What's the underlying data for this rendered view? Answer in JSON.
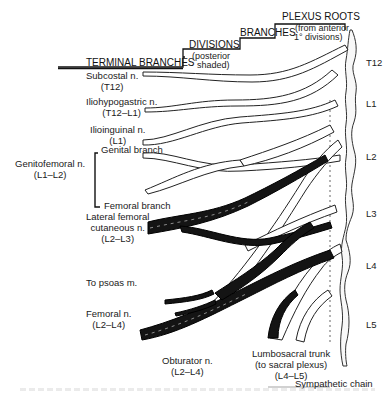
{
  "figure": {
    "type": "anatomical-diagram"
  },
  "headers": {
    "terminal_branches": "TERMINAL BRANCHES",
    "divisions": "DIVISIONS",
    "divisions_note_1": "(posterior",
    "divisions_note_2": "shaded)",
    "branches": "BRANCHES",
    "plexus_roots": "PLEXUS ROOTS",
    "plexus_roots_note_1": "(from anterior",
    "plexus_roots_note_2": "1° divisions)"
  },
  "nerves": [
    {
      "name": "Subcostal n.",
      "roots": "(T12)"
    },
    {
      "name": "Iliohypogastric n.",
      "roots": "(T12–L1)"
    },
    {
      "name": "Ilioinguinal n.",
      "roots": "(L1)"
    },
    {
      "name": "Genitofemoral n.",
      "roots": "(L1–L2)",
      "branches": [
        "Genital branch",
        "Femoral branch"
      ]
    },
    {
      "name": "Lateral femoral",
      "name2": "cutaneous n.",
      "roots": "(L2–L3)"
    },
    {
      "name": "To psoas m."
    },
    {
      "name": "Femoral n.",
      "roots": "(L2–L4)"
    },
    {
      "name": "Obturator n.",
      "roots": "(L2–L4)"
    },
    {
      "name": "Lumbosacral trunk",
      "name2": "(to sacral plexus)",
      "roots": "(L4–L5)"
    }
  ],
  "other_labels": {
    "sympathetic_chain": "Sympathetic chain"
  },
  "spinal_levels": [
    "T12",
    "L1",
    "L2",
    "L3",
    "L4",
    "L5"
  ],
  "colors": {
    "anterior_division": "#ffffff",
    "posterior_division": "#111111",
    "outline": "#222222"
  }
}
